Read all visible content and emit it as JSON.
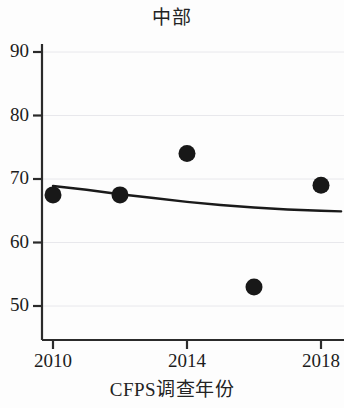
{
  "chart_data": {
    "type": "scatter",
    "title": "中部",
    "xlabel": "CFPS调查年份",
    "ylabel": "",
    "x": [
      2010,
      2012,
      2014,
      2016,
      2018
    ],
    "values": [
      67.5,
      67.5,
      74.0,
      53.0,
      69.0
    ],
    "series": [
      {
        "name": "观测值",
        "type": "scatter",
        "x": [
          2010,
          2012,
          2014,
          2016,
          2018
        ],
        "values": [
          67.5,
          67.5,
          74.0,
          53.0,
          69.0
        ]
      },
      {
        "name": "拟合曲线",
        "type": "line",
        "x": [
          2010,
          2011,
          2012,
          2013,
          2014,
          2015,
          2016,
          2017,
          2018,
          2018.6
        ],
        "values": [
          68.9,
          68.3,
          67.6,
          67.0,
          66.4,
          65.9,
          65.5,
          65.2,
          65.0,
          64.9
        ]
      }
    ],
    "xlim": [
      2009.3,
      2018.7
    ],
    "ylim": [
      47.0,
      92.0
    ],
    "xticks": [
      2010,
      2014,
      2018
    ],
    "xtick_labels": [
      "2010",
      "2014",
      "2018"
    ],
    "yticks": [
      50,
      60,
      70,
      80,
      90
    ],
    "ytick_labels": [
      "50",
      "60",
      "70",
      "80",
      "90"
    ],
    "grid": true,
    "grid_axis": "y",
    "legend": "none",
    "point_color": "#181818",
    "line_color": "#1a1a1a",
    "grid_color": "#e8e8ec",
    "axis_color": "#2b2b2b"
  }
}
